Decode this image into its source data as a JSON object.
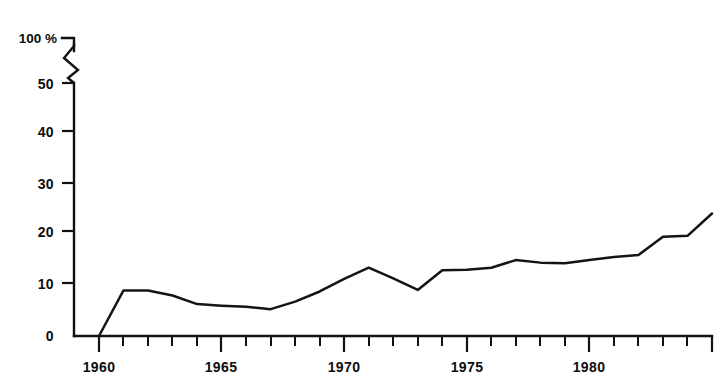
{
  "chart_data": {
    "type": "line",
    "title": "",
    "subtitle": "",
    "xlabel": "",
    "ylabel": "",
    "y_unit_label": "100 %",
    "axis_break": {
      "present": true,
      "between": [
        50,
        100
      ],
      "style": "zigzag"
    },
    "grid": false,
    "legend": "none",
    "xlim": [
      1959,
      1986
    ],
    "ylim": [
      0,
      50
    ],
    "y_ticks": [
      0,
      10,
      20,
      30,
      40,
      50,
      100
    ],
    "y_tick_labels": [
      "0",
      "10",
      "20",
      "30",
      "40",
      "50",
      "100 %"
    ],
    "x_ticks": [
      1960,
      1965,
      1970,
      1975,
      1980,
      1985
    ],
    "x_tick_labels": [
      "1960",
      "1965",
      "1970",
      "1975",
      "1980",
      ""
    ],
    "x_minor_ticks": [
      1961,
      1962,
      1963,
      1964,
      1966,
      1967,
      1968,
      1969,
      1971,
      1972,
      1973,
      1974,
      1976,
      1977,
      1978,
      1979,
      1981,
      1982,
      1983,
      1984
    ],
    "series": [
      {
        "name": "share",
        "color": "#141414",
        "x": [
          1960,
          1961,
          1962,
          1963,
          1964,
          1965,
          1966,
          1967,
          1968,
          1969,
          1970,
          1971,
          1972,
          1973,
          1974,
          1975,
          1976,
          1977,
          1978,
          1979,
          1980,
          1981,
          1982,
          1983,
          1984,
          1985
        ],
        "values": [
          0,
          9.0,
          9.0,
          8.0,
          6.3,
          6.0,
          5.8,
          5.3,
          6.8,
          8.8,
          11.3,
          13.5,
          11.4,
          9.1,
          13.0,
          13.1,
          13.5,
          15.0,
          14.5,
          14.4,
          15.0,
          15.6,
          16.0,
          19.6,
          19.8,
          24.2
        ]
      }
    ]
  }
}
